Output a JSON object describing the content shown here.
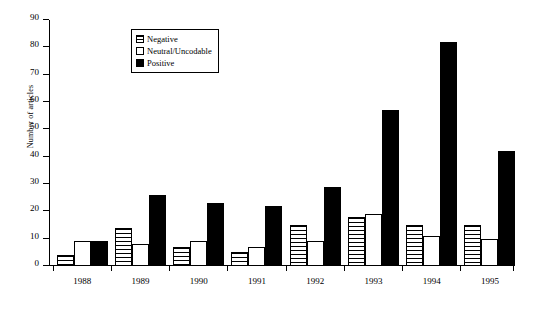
{
  "chart_data": {
    "type": "bar",
    "title": "",
    "xlabel": "",
    "ylabel": "Number of articles",
    "ylim": [
      0,
      90
    ],
    "yticks": [
      0,
      10,
      20,
      30,
      40,
      50,
      60,
      70,
      80,
      90
    ],
    "grid": false,
    "legend_position": "top-left-inside",
    "categories": [
      "1988",
      "1989",
      "1990",
      "1991",
      "1992",
      "1993",
      "1994",
      "1995"
    ],
    "series": [
      {
        "name": "Negative",
        "values": [
          4,
          14,
          7,
          5,
          15,
          18,
          15,
          15
        ],
        "fill": "horizontal-hatch",
        "color": "#000000"
      },
      {
        "name": "Neutral/Uncodable",
        "values": [
          9,
          8,
          9,
          7,
          9,
          19,
          11,
          10
        ],
        "fill": "white",
        "color": "#ffffff"
      },
      {
        "name": "Positive",
        "values": [
          9,
          26,
          23,
          22,
          29,
          57,
          82,
          42
        ],
        "fill": "solid",
        "color": "#000000"
      }
    ]
  },
  "axis": {
    "y_title": "Number of articles"
  },
  "legend": {
    "items": [
      {
        "label": "Negative"
      },
      {
        "label": "Neutral/Uncodable"
      },
      {
        "label": "Positive"
      }
    ]
  }
}
